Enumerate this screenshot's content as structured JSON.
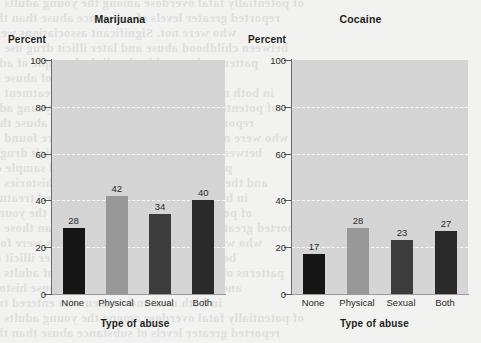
{
  "background": {
    "page_tint": "#f2f2f0",
    "bleed_lines": [
      "of potentially fatal overdose among the young adults",
      "reported greater levels of substance abuse than those",
      "who were not. Significant associations were found",
      "between childhood abuse and later illicit drug use",
      "patterns observed in the clinical sample of adults",
      "and the reported prevalence of abuse histories",
      "in both men and women who entered treatment"
    ]
  },
  "chart_data": [
    {
      "type": "bar",
      "title": "Marijuana",
      "xlabel": "Type of abuse",
      "ylabel": "Percent",
      "categories": [
        "None",
        "Physical",
        "Sexual",
        "Both"
      ],
      "values": [
        28,
        42,
        34,
        40
      ],
      "ylim": [
        0,
        100
      ],
      "yticks": [
        0,
        20,
        40,
        60,
        80,
        100
      ],
      "gridlines": [
        20,
        40,
        60,
        80
      ],
      "grid": true,
      "grid_style": "dashed-white",
      "legend": "none",
      "bar_colors": [
        "#161616",
        "#989898",
        "#3c3c3c",
        "#2a2a2a"
      ],
      "plot_background": "#d5d5d5"
    },
    {
      "type": "bar",
      "title": "Cocaine",
      "xlabel": "Type of abuse",
      "ylabel": "Percent",
      "categories": [
        "None",
        "Physical",
        "Sexual",
        "Both"
      ],
      "values": [
        17,
        28,
        23,
        27
      ],
      "ylim": [
        0,
        100
      ],
      "yticks": [
        0,
        20,
        40,
        60,
        80,
        100
      ],
      "gridlines": [
        20,
        40,
        60,
        80
      ],
      "grid": true,
      "grid_style": "dashed-white",
      "legend": "none",
      "bar_colors": [
        "#161616",
        "#989898",
        "#3c3c3c",
        "#2a2a2a"
      ],
      "plot_background": "#d5d5d5"
    }
  ]
}
